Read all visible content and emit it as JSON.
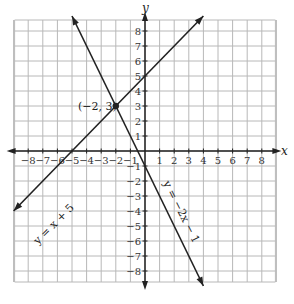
{
  "chart_data": {
    "type": "line",
    "title": "",
    "xlabel": "x",
    "ylabel": "y",
    "xlim": [
      -9,
      9
    ],
    "ylim": [
      -9,
      9
    ],
    "grid": true,
    "x_ticks": [
      "-8",
      "-7",
      "-6",
      "-5",
      "-4",
      "-3",
      "-2",
      "-1",
      "1",
      "2",
      "3",
      "4",
      "5",
      "6",
      "7",
      "8"
    ],
    "y_ticks": [
      "8",
      "7",
      "6",
      "5",
      "4",
      "3",
      "2",
      "1",
      "-1",
      "-2",
      "-3",
      "-4",
      "-5",
      "-6",
      "-7",
      "-8"
    ],
    "series": [
      {
        "name": "y = x + 5",
        "slope": 1,
        "intercept": 5,
        "x": [
          -9,
          4
        ],
        "y": [
          -4,
          9
        ]
      },
      {
        "name": "y = −2x − 1",
        "slope": -2,
        "intercept": -1,
        "x": [
          -5,
          4
        ],
        "y": [
          9,
          -9
        ]
      }
    ],
    "annotations": [
      {
        "text": "(−2, 3)",
        "x": -2,
        "y": 3,
        "type": "intersection-point"
      }
    ]
  },
  "labels": {
    "x_axis": "x",
    "y_axis": "y",
    "line1": "y = x + 5",
    "line2": "y = −2x − 1",
    "point": "(−2, 3)"
  },
  "colors": {
    "grid": "#b8b8b8",
    "axis": "#222222",
    "line": "#222222"
  }
}
